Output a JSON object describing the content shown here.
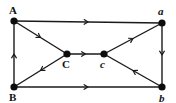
{
  "diagram": {
    "type": "directed-graph",
    "nodes": [
      {
        "id": "A",
        "label": "A",
        "x": 14,
        "y": 21,
        "style": "bold"
      },
      {
        "id": "a",
        "label": "a",
        "x": 162,
        "y": 23,
        "style": "italic"
      },
      {
        "id": "C",
        "label": "C",
        "x": 67,
        "y": 54,
        "style": "bold"
      },
      {
        "id": "c",
        "label": "c",
        "x": 104,
        "y": 54,
        "style": "italic"
      },
      {
        "id": "B",
        "label": "B",
        "x": 14,
        "y": 87,
        "style": "bold"
      },
      {
        "id": "b",
        "label": "b",
        "x": 162,
        "y": 87,
        "style": "italic"
      }
    ],
    "edges": [
      {
        "from": "A",
        "to": "a"
      },
      {
        "from": "A",
        "to": "C"
      },
      {
        "from": "C",
        "to": "c"
      },
      {
        "from": "c",
        "to": "a"
      },
      {
        "from": "a",
        "to": "b"
      },
      {
        "from": "b",
        "to": "c"
      },
      {
        "from": "C",
        "to": "B"
      },
      {
        "from": "B",
        "to": "A"
      },
      {
        "from": "B",
        "to": "b"
      }
    ],
    "colors": {
      "line": "#1a1a1a",
      "node": "#0d0d0d",
      "background": "#ffffff"
    }
  }
}
